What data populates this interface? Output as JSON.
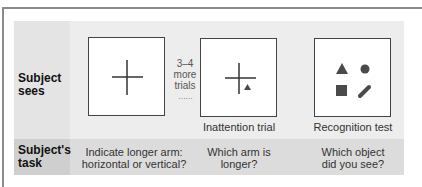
{
  "rows": {
    "sees_label": [
      "Subject",
      "sees"
    ],
    "task_label": [
      "Subject's",
      "task"
    ]
  },
  "panels": [
    {
      "stimulus": "cross",
      "caption": "",
      "task": [
        "Indicate longer arm:",
        "horizontal or vertical?"
      ]
    },
    {
      "stimulus": "cross-with-triangle",
      "caption": "Inattention trial",
      "task": [
        "Which arm is",
        "longer?"
      ]
    },
    {
      "stimulus": "shapes-array",
      "caption": "Recognition test",
      "task": [
        "Which object",
        "did you see?"
      ]
    }
  ],
  "between": {
    "lines": [
      "3–4",
      "more",
      "trials"
    ],
    "ellipsis": "……"
  },
  "colors": {
    "panel_bg": "#ededed",
    "label_bg": "#e4e4e4",
    "task_row_bg": "#dcdcdc",
    "task_label_bg": "#cfcfcf",
    "stroke": "#333333",
    "shape_fill": "#4a4a4a"
  }
}
